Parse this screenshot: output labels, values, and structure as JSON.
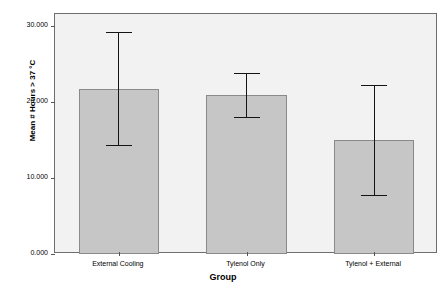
{
  "chart_data": {
    "type": "bar",
    "title": "",
    "xlabel": "Group",
    "ylabel": "Mean # Hours > 37 °C",
    "categories": [
      "External Cooling",
      "Tylenol Only",
      "Tylenol + External"
    ],
    "values": [
      21.7,
      21.0,
      15.0
    ],
    "error_low": [
      14.2,
      17.9,
      7.7
    ],
    "error_high": [
      29.2,
      23.8,
      22.2
    ],
    "series": [
      {
        "name": "Mean # Hours > 37 °C",
        "values": [
          21.7,
          21.0,
          15.0
        ]
      }
    ],
    "ylim": [
      0,
      31.6
    ],
    "xlim": [
      0,
      3
    ],
    "yticks": [
      0,
      10,
      20,
      30
    ],
    "ytick_labels": [
      "0.000",
      "10.000",
      "20.000",
      "30.000"
    ],
    "grid": false,
    "legend": false,
    "legend_position": "none",
    "bar_fill_color": "#c6c6c6",
    "bar_border_color": "#8a8a8a",
    "error_bar_color": "#141414",
    "plot_background_color": "#f2f2f2",
    "frame_color": "#6e6e6e",
    "error_bar_kind": "95% CI"
  }
}
